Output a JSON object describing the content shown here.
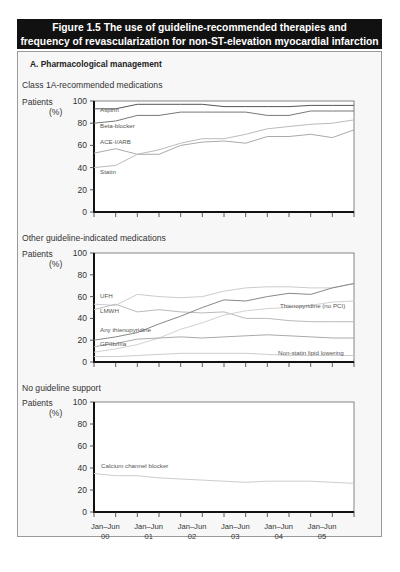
{
  "figure": {
    "title_line1": "Figure 1.5 The use of guideline-recommended therapies and",
    "title_line2": "frequency of revascularization for non-ST-elevation myocardial infarction",
    "panel_heading": "A. Pharmacological management"
  },
  "axes": {
    "ylabel_line1": "Patients",
    "ylabel_line2": "(%)",
    "yticks": [
      "0",
      "20",
      "40",
      "60",
      "80",
      "100"
    ],
    "xticks": [
      {
        "line1": "Jan–Jun",
        "line2": "00"
      },
      {
        "line1": "Jan–Jun",
        "line2": "01"
      },
      {
        "line1": "Jan–Jun",
        "line2": "02"
      },
      {
        "line1": "Jan–Jun",
        "line2": "03"
      },
      {
        "line1": "Jan–Jun",
        "line2": "04"
      },
      {
        "line1": "Jan–Jun",
        "line2": "05"
      }
    ]
  },
  "chart_data": [
    {
      "type": "line",
      "title": "Class 1A-recommended medications",
      "xlabel": "",
      "ylabel": "Patients (%)",
      "ylim": [
        0,
        100
      ],
      "x": [
        "Jan-Jun 00",
        "Jul-Dec 00",
        "Jan-Jun 01",
        "Jul-Dec 01",
        "Jan-Jun 02",
        "Jul-Dec 02",
        "Jan-Jun 03",
        "Jul-Dec 03",
        "Jan-Jun 04",
        "Jul-Dec 04",
        "Jan-Jun 05",
        "Jul-Dec 05",
        "end"
      ],
      "series": [
        {
          "name": "Aspirin",
          "color": "#555555",
          "values": [
            93,
            93,
            97,
            97,
            97,
            97,
            95,
            95,
            95,
            95,
            96,
            96,
            96
          ]
        },
        {
          "name": "Beta-blocker",
          "color": "#777777",
          "values": [
            80,
            82,
            87,
            87,
            90,
            90,
            90,
            90,
            87,
            87,
            91,
            91,
            91
          ]
        },
        {
          "name": "ACE-I/ARB",
          "color": "#aaaaaa",
          "values": [
            53,
            57,
            52,
            52,
            60,
            63,
            64,
            62,
            68,
            68,
            70,
            67,
            74
          ]
        },
        {
          "name": "Statin",
          "color": "#bbbbbb",
          "values": [
            40,
            42,
            52,
            56,
            62,
            66,
            66,
            70,
            75,
            77,
            79,
            80,
            83
          ]
        }
      ]
    },
    {
      "type": "line",
      "title": "Other guideline-indicated medications",
      "xlabel": "",
      "ylabel": "Patients (%)",
      "ylim": [
        0,
        100
      ],
      "x": [
        "Jan-Jun 00",
        "Jul-Dec 00",
        "Jan-Jun 01",
        "Jul-Dec 01",
        "Jan-Jun 02",
        "Jul-Dec 02",
        "Jan-Jun 03",
        "Jul-Dec 03",
        "Jan-Jun 04",
        "Jul-Dec 04",
        "Jan-Jun 05",
        "Jul-Dec 05",
        "end"
      ],
      "series": [
        {
          "name": "UFH",
          "color": "#cccccc",
          "values": [
            53,
            52,
            62,
            60,
            59,
            60,
            65,
            68,
            69,
            69,
            68,
            68,
            72
          ]
        },
        {
          "name": "LMWH",
          "color": "#bbbbbb",
          "values": [
            48,
            53,
            46,
            48,
            46,
            45,
            46,
            40,
            40,
            38,
            37,
            37,
            37
          ]
        },
        {
          "name": "Any thienopyridine",
          "color": "#888888",
          "values": [
            20,
            23,
            27,
            35,
            42,
            50,
            57,
            56,
            60,
            63,
            62,
            68,
            72
          ]
        },
        {
          "name": "Thienopyridine (no PCI)",
          "color": "#d2d2d2",
          "values": [
            9,
            12,
            16,
            22,
            30,
            36,
            43,
            47,
            49,
            50,
            52,
            55,
            56
          ]
        },
        {
          "name": "GPIIb/IIIa",
          "color": "#aaaaaa",
          "values": [
            14,
            17,
            21,
            22,
            23,
            22,
            23,
            24,
            25,
            24,
            23,
            22,
            22
          ]
        },
        {
          "name": "Non-statin lipid lowering",
          "color": "#cccccc",
          "values": [
            5,
            5,
            6,
            7,
            8,
            8,
            8,
            8,
            7,
            6,
            6,
            6,
            6
          ]
        }
      ]
    },
    {
      "type": "line",
      "title": "No guideline support",
      "xlabel": "",
      "ylabel": "Patients (%)",
      "ylim": [
        0,
        100
      ],
      "x": [
        "Jan-Jun 00",
        "Jul-Dec 00",
        "Jan-Jun 01",
        "Jul-Dec 01",
        "Jan-Jun 02",
        "Jul-Dec 02",
        "Jan-Jun 03",
        "Jul-Dec 03",
        "Jan-Jun 04",
        "Jul-Dec 04",
        "Jan-Jun 05",
        "Jul-Dec 05",
        "end"
      ],
      "series": [
        {
          "name": "Calcium channel blocker",
          "color": "#cccccc",
          "values": [
            35,
            33,
            33,
            31,
            30,
            29,
            28,
            27,
            28,
            28,
            28,
            27,
            26
          ]
        }
      ]
    }
  ],
  "labels": {
    "chart1": [
      {
        "text": "Aspirin",
        "x": 100,
        "y": 112
      },
      {
        "text": "Beta-blocker",
        "x": 100,
        "y": 128
      },
      {
        "text": "ACE-I/ARB",
        "x": 100,
        "y": 144
      },
      {
        "text": "Statin",
        "x": 100,
        "y": 174
      }
    ],
    "chart2": [
      {
        "text": "UFH",
        "x": 100,
        "y": 298
      },
      {
        "text": "LMWH",
        "x": 100,
        "y": 313
      },
      {
        "text": "Any thienopyridine",
        "x": 100,
        "y": 332
      },
      {
        "text": "GPIIb/IIIa",
        "x": 100,
        "y": 346
      },
      {
        "text": "Thienopyridine (no PCI)",
        "x": 280,
        "y": 308
      },
      {
        "text": "Non-statin lipid lowering",
        "x": 278,
        "y": 355
      }
    ],
    "chart3": [
      {
        "text": "Calcium channel blocker",
        "x": 101,
        "y": 468
      }
    ]
  }
}
